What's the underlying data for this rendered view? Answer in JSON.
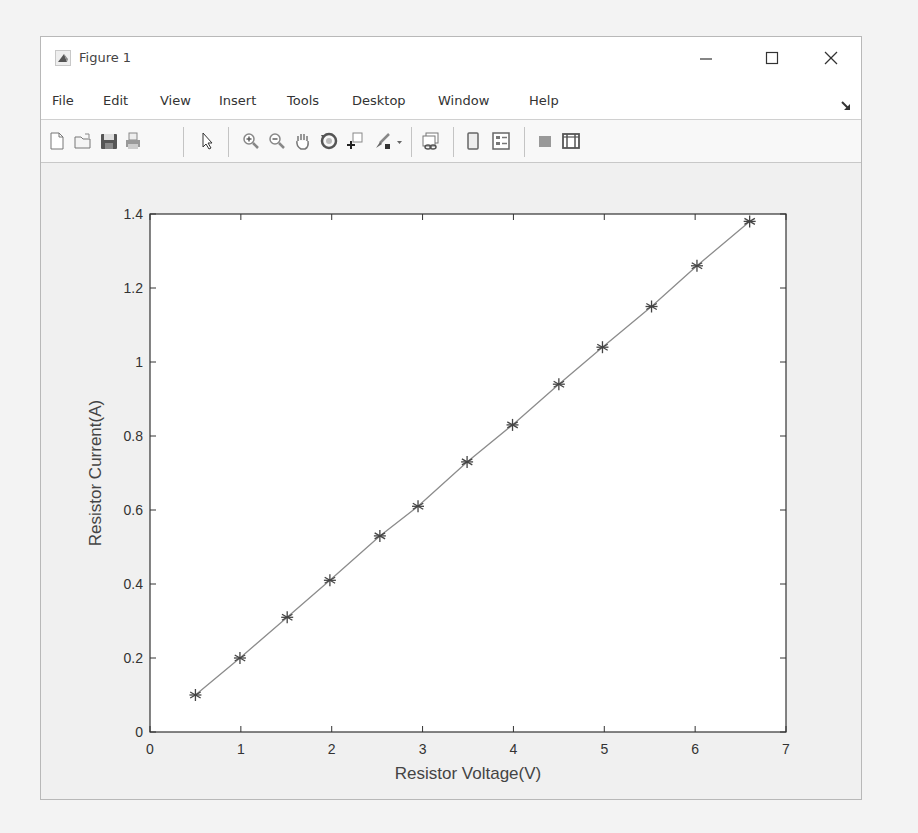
{
  "window": {
    "title": "Figure 1",
    "controls": {
      "minimize": "minimize",
      "maximize": "maximize",
      "close": "close"
    }
  },
  "menu": {
    "items": [
      "File",
      "Edit",
      "View",
      "Insert",
      "Tools",
      "Desktop",
      "Window",
      "Help"
    ]
  },
  "toolbar": {
    "buttons": [
      {
        "name": "new-figure",
        "icon": "new-document-icon"
      },
      {
        "name": "open-file",
        "icon": "folder-open-icon"
      },
      {
        "name": "save-figure",
        "icon": "floppy-disk-icon"
      },
      {
        "name": "print-figure",
        "icon": "printer-icon"
      },
      {
        "name": "edit-plot",
        "icon": "pointer-arrow-icon"
      },
      {
        "name": "zoom-in",
        "icon": "zoom-in-icon"
      },
      {
        "name": "zoom-out",
        "icon": "zoom-out-icon"
      },
      {
        "name": "pan",
        "icon": "hand-icon"
      },
      {
        "name": "rotate-3d",
        "icon": "rotate-icon"
      },
      {
        "name": "data-cursor",
        "icon": "data-cursor-icon"
      },
      {
        "name": "brush",
        "icon": "brush-icon"
      },
      {
        "name": "brush-dropdown",
        "icon": "dropdown-arrow-icon"
      },
      {
        "name": "link-plot",
        "icon": "link-plot-icon"
      },
      {
        "name": "insert-colorbar",
        "icon": "colorbar-icon"
      },
      {
        "name": "insert-legend",
        "icon": "legend-icon"
      },
      {
        "name": "hide-plot-tools",
        "icon": "hide-tools-icon"
      },
      {
        "name": "show-plot-tools",
        "icon": "show-tools-icon"
      }
    ]
  },
  "colors": {
    "axis": "#333333",
    "line": "#8c8c8c",
    "marker": "#444444",
    "plot_bg": "#ffffff",
    "figure_bg": "#f0f0f0"
  },
  "chart_data": {
    "type": "line",
    "title": "",
    "xlabel": "Resistor Voltage(V)",
    "ylabel": "Resistor Current(A)",
    "xlim": [
      0,
      7
    ],
    "ylim": [
      0,
      1.4
    ],
    "xticks": [
      0,
      1,
      2,
      3,
      4,
      5,
      6,
      7
    ],
    "yticks": [
      0,
      0.2,
      0.4,
      0.6,
      0.8,
      1,
      1.2,
      1.4
    ],
    "xtick_labels": [
      "0",
      "1",
      "2",
      "3",
      "4",
      "5",
      "6",
      "7"
    ],
    "ytick_labels": [
      "0",
      "0.2",
      "0.4",
      "0.6",
      "0.8",
      "1",
      "1.2",
      "1.4"
    ],
    "grid": false,
    "legend": null,
    "marker": "*",
    "series": [
      {
        "name": "Resistor I-V",
        "x": [
          0.5,
          0.99,
          1.51,
          1.98,
          2.53,
          2.95,
          3.49,
          3.99,
          4.5,
          4.98,
          5.52,
          6.02,
          6.6
        ],
        "y": [
          0.1,
          0.2,
          0.31,
          0.41,
          0.53,
          0.61,
          0.73,
          0.83,
          0.94,
          1.04,
          1.15,
          1.26,
          1.38
        ]
      }
    ]
  }
}
